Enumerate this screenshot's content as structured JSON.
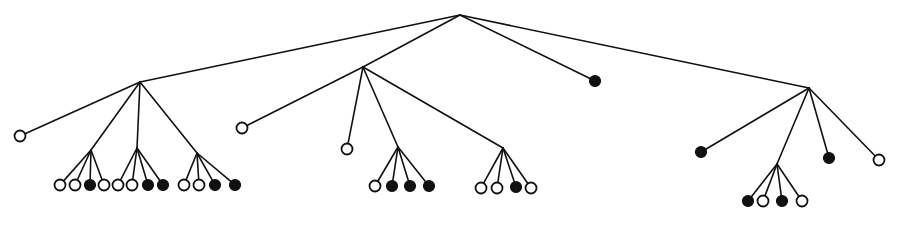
{
  "diagram": {
    "type": "tree",
    "leaf_radius": 5.5,
    "nodes": [
      {
        "id": "root",
        "x": 460,
        "y": 15,
        "kind": "internal"
      },
      {
        "id": "A",
        "parent": "root",
        "x": 140,
        "y": 82,
        "kind": "internal"
      },
      {
        "id": "B",
        "parent": "root",
        "x": 363,
        "y": 67,
        "kind": "internal"
      },
      {
        "id": "C",
        "parent": "root",
        "x": 595,
        "y": 81,
        "kind": "leaf",
        "fill": "filled"
      },
      {
        "id": "D",
        "parent": "root",
        "x": 809,
        "y": 88,
        "kind": "internal"
      },
      {
        "id": "A0",
        "parent": "A",
        "x": 20,
        "y": 136,
        "kind": "leaf",
        "fill": "open"
      },
      {
        "id": "A1",
        "parent": "A",
        "x": 91,
        "y": 150,
        "kind": "internal"
      },
      {
        "id": "A2",
        "parent": "A",
        "x": 137,
        "y": 148,
        "kind": "internal"
      },
      {
        "id": "A3",
        "parent": "A",
        "x": 197,
        "y": 153,
        "kind": "internal"
      },
      {
        "id": "A1a",
        "parent": "A1",
        "x": 60,
        "y": 185,
        "kind": "leaf",
        "fill": "open"
      },
      {
        "id": "A1b",
        "parent": "A1",
        "x": 75,
        "y": 185,
        "kind": "leaf",
        "fill": "open"
      },
      {
        "id": "A1c",
        "parent": "A1",
        "x": 90,
        "y": 185,
        "kind": "leaf",
        "fill": "filled"
      },
      {
        "id": "A1d",
        "parent": "A1",
        "x": 104,
        "y": 185,
        "kind": "leaf",
        "fill": "open"
      },
      {
        "id": "A2a",
        "parent": "A2",
        "x": 118,
        "y": 185,
        "kind": "leaf",
        "fill": "open"
      },
      {
        "id": "A2b",
        "parent": "A2",
        "x": 132,
        "y": 185,
        "kind": "leaf",
        "fill": "open"
      },
      {
        "id": "A2c",
        "parent": "A2",
        "x": 148,
        "y": 185,
        "kind": "leaf",
        "fill": "filled"
      },
      {
        "id": "A2d",
        "parent": "A2",
        "x": 163,
        "y": 185,
        "kind": "leaf",
        "fill": "filled"
      },
      {
        "id": "A3a",
        "parent": "A3",
        "x": 184,
        "y": 185,
        "kind": "leaf",
        "fill": "open"
      },
      {
        "id": "A3b",
        "parent": "A3",
        "x": 199,
        "y": 185,
        "kind": "leaf",
        "fill": "open"
      },
      {
        "id": "A3c",
        "parent": "A3",
        "x": 215,
        "y": 185,
        "kind": "leaf",
        "fill": "filled"
      },
      {
        "id": "A3d",
        "parent": "A3",
        "x": 235,
        "y": 185,
        "kind": "leaf",
        "fill": "filled"
      },
      {
        "id": "B0",
        "parent": "B",
        "x": 242,
        "y": 128,
        "kind": "leaf",
        "fill": "open"
      },
      {
        "id": "B1",
        "parent": "B",
        "x": 347,
        "y": 149,
        "kind": "leaf",
        "fill": "open"
      },
      {
        "id": "B2",
        "parent": "B",
        "x": 398,
        "y": 147,
        "kind": "internal"
      },
      {
        "id": "B3",
        "parent": "B",
        "x": 503,
        "y": 148,
        "kind": "internal"
      },
      {
        "id": "B2a",
        "parent": "B2",
        "x": 375,
        "y": 186,
        "kind": "leaf",
        "fill": "open"
      },
      {
        "id": "B2b",
        "parent": "B2",
        "x": 392,
        "y": 186,
        "kind": "leaf",
        "fill": "filled"
      },
      {
        "id": "B2c",
        "parent": "B2",
        "x": 410,
        "y": 186,
        "kind": "leaf",
        "fill": "filled"
      },
      {
        "id": "B2d",
        "parent": "B2",
        "x": 429,
        "y": 186,
        "kind": "leaf",
        "fill": "filled"
      },
      {
        "id": "B3a",
        "parent": "B3",
        "x": 481,
        "y": 188,
        "kind": "leaf",
        "fill": "open"
      },
      {
        "id": "B3b",
        "parent": "B3",
        "x": 497,
        "y": 188,
        "kind": "leaf",
        "fill": "open"
      },
      {
        "id": "B3c",
        "parent": "B3",
        "x": 516,
        "y": 187,
        "kind": "leaf",
        "fill": "filled"
      },
      {
        "id": "B3d",
        "parent": "B3",
        "x": 531,
        "y": 188,
        "kind": "leaf",
        "fill": "open"
      },
      {
        "id": "D0",
        "parent": "D",
        "x": 701,
        "y": 152,
        "kind": "leaf",
        "fill": "filled"
      },
      {
        "id": "D1",
        "parent": "D",
        "x": 777,
        "y": 164,
        "kind": "internal"
      },
      {
        "id": "D2",
        "parent": "D",
        "x": 829,
        "y": 158,
        "kind": "leaf",
        "fill": "filled"
      },
      {
        "id": "D3",
        "parent": "D",
        "x": 879,
        "y": 160,
        "kind": "leaf",
        "fill": "open"
      },
      {
        "id": "D1a",
        "parent": "D1",
        "x": 748,
        "y": 201,
        "kind": "leaf",
        "fill": "filled"
      },
      {
        "id": "D1b",
        "parent": "D1",
        "x": 763,
        "y": 201,
        "kind": "leaf",
        "fill": "open"
      },
      {
        "id": "D1c",
        "parent": "D1",
        "x": 782,
        "y": 201,
        "kind": "leaf",
        "fill": "filled"
      },
      {
        "id": "D1d",
        "parent": "D1",
        "x": 802,
        "y": 201,
        "kind": "leaf",
        "fill": "open"
      }
    ]
  }
}
